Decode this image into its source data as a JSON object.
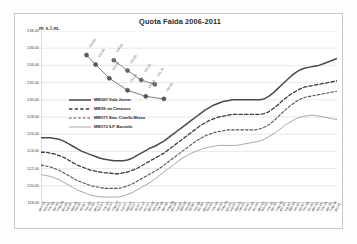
{
  "chart_data": {
    "type": "line",
    "title": "Quota Falda 2006-2011",
    "xlabel": "",
    "ylabel": "m s.l.m.",
    "ylim": [
      118.0,
      138.0
    ],
    "ytick_step": 2.0,
    "yticks": [
      "138,00",
      "136,00",
      "134,00",
      "132,00",
      "130,00",
      "128,00",
      "126,00",
      "124,00",
      "122,00",
      "120,00",
      "118,00"
    ],
    "grid": true,
    "legend_position": "inside-upper-left",
    "x": [
      "gen-06",
      "feb-06",
      "mar-06",
      "apr-06",
      "mag-06",
      "giu-06",
      "lug-06",
      "ago-06",
      "set-06",
      "ott-06",
      "nov-06",
      "dic-06",
      "gen-07",
      "feb-07",
      "mar-07",
      "apr-07",
      "mag-07",
      "giu-07",
      "lug-07",
      "ago-07",
      "set-07",
      "ott-07",
      "nov-07",
      "dic-07",
      "gen-08",
      "feb-08",
      "mar-08",
      "apr-08",
      "mag-08",
      "giu-08",
      "lug-08",
      "ago-08",
      "set-08",
      "ott-08",
      "nov-08",
      "dic-08",
      "gen-09",
      "feb-09",
      "mar-09",
      "apr-09",
      "mag-09",
      "giu-09",
      "lug-09",
      "ago-09",
      "set-09",
      "ott-09",
      "nov-09",
      "dic-09",
      "gen-10",
      "feb-10",
      "mar-10",
      "apr-10",
      "mag-10",
      "giu-10",
      "lug-10",
      "ago-10",
      "set-10",
      "ott-10",
      "nov-10",
      "dic-10",
      "gen-11",
      "feb-11",
      "mar-11",
      "apr-11",
      "mag-11",
      "giu-11"
    ],
    "series": [
      {
        "name": "MM/307 Viale Jenner",
        "style": "solid-dark",
        "color": "#4a4a4a",
        "values": [
          125.6,
          125.6,
          125.6,
          125.5,
          125.4,
          125.2,
          124.9,
          124.6,
          124.3,
          124.0,
          123.8,
          123.6,
          123.4,
          123.2,
          123.1,
          123.0,
          122.9,
          122.9,
          122.9,
          123.0,
          123.2,
          123.5,
          123.8,
          124.1,
          124.4,
          124.6,
          124.9,
          125.2,
          125.6,
          126.0,
          126.4,
          126.8,
          127.2,
          127.6,
          128.0,
          128.4,
          128.8,
          129.1,
          129.4,
          129.6,
          129.8,
          129.9,
          130.0,
          130.0,
          130.0,
          130.0,
          130.0,
          130.0,
          130.0,
          130.1,
          130.4,
          130.8,
          131.3,
          131.8,
          132.3,
          132.8,
          133.2,
          133.5,
          133.7,
          133.8,
          133.9,
          134.0,
          134.2,
          134.4,
          134.6,
          134.8
        ]
      },
      {
        "name": "MM/29 via Cimarosa",
        "style": "dashed-dark",
        "color": "#3c3c3c",
        "values": [
          123.9,
          123.9,
          123.8,
          123.7,
          123.5,
          123.3,
          123.0,
          122.7,
          122.4,
          122.2,
          122.0,
          121.8,
          121.7,
          121.6,
          121.5,
          121.5,
          121.4,
          121.4,
          121.5,
          121.6,
          121.8,
          122.0,
          122.3,
          122.6,
          122.9,
          123.2,
          123.5,
          123.8,
          124.2,
          124.6,
          125.0,
          125.4,
          125.8,
          126.2,
          126.6,
          127.0,
          127.3,
          127.6,
          127.8,
          128.0,
          128.1,
          128.2,
          128.3,
          128.3,
          128.3,
          128.3,
          128.3,
          128.3,
          128.3,
          128.4,
          128.6,
          129.0,
          129.4,
          129.9,
          130.3,
          130.7,
          131.0,
          131.3,
          131.5,
          131.6,
          131.7,
          131.8,
          131.9,
          132.0,
          132.1,
          132.2
        ]
      },
      {
        "name": "MM/171 Stac. Cistello Mezzo",
        "style": "dashed-mid",
        "color": "#555555",
        "values": [
          122.4,
          122.3,
          122.2,
          122.0,
          121.8,
          121.5,
          121.2,
          120.9,
          120.6,
          120.4,
          120.2,
          120.0,
          119.9,
          119.8,
          119.7,
          119.7,
          119.7,
          119.7,
          119.8,
          120.0,
          120.2,
          120.5,
          120.8,
          121.1,
          121.4,
          121.7,
          122.0,
          122.4,
          122.8,
          123.2,
          123.6,
          124.0,
          124.4,
          124.8,
          125.2,
          125.5,
          125.8,
          126.0,
          126.2,
          126.3,
          126.4,
          126.5,
          126.5,
          126.5,
          126.5,
          126.5,
          126.5,
          126.5,
          126.6,
          126.8,
          127.1,
          127.5,
          128.0,
          128.5,
          129.0,
          129.4,
          129.8,
          130.1,
          130.3,
          130.4,
          130.5,
          130.6,
          130.7,
          130.8,
          130.9,
          131.0
        ]
      },
      {
        "name": "MM/172 S.P. Bacciolo",
        "style": "solid-light",
        "color": "#a8a8a8",
        "values": [
          121.3,
          121.2,
          121.1,
          120.9,
          120.7,
          120.4,
          120.1,
          119.8,
          119.5,
          119.3,
          119.1,
          118.9,
          118.8,
          118.7,
          118.7,
          118.7,
          118.7,
          118.7,
          118.8,
          119.0,
          119.2,
          119.5,
          119.8,
          120.1,
          120.4,
          120.8,
          121.2,
          121.6,
          122.0,
          122.4,
          122.8,
          123.2,
          123.5,
          123.8,
          124.0,
          124.2,
          124.4,
          124.5,
          124.6,
          124.7,
          124.7,
          124.7,
          124.7,
          124.7,
          124.8,
          124.9,
          125.0,
          125.1,
          125.2,
          125.4,
          125.7,
          126.0,
          126.4,
          126.8,
          127.2,
          127.5,
          127.8,
          128.0,
          128.1,
          128.2,
          128.2,
          128.1,
          128.0,
          127.9,
          127.8,
          127.7
        ]
      }
    ],
    "overlay_series": [
      {
        "name": "serie-marcata-1",
        "marker": "circle",
        "color": "#5a5a5a",
        "points": [
          {
            "x_index": 10,
            "y": 135.2,
            "label": "134,80"
          },
          {
            "x_index": 12,
            "y": 134.1,
            "label": "133,90"
          },
          {
            "x_index": 15,
            "y": 132.5,
            "label": "132,40"
          },
          {
            "x_index": 19,
            "y": 131.1,
            "label": "131,20"
          },
          {
            "x_index": 23,
            "y": 130.4,
            "label": "130,50"
          },
          {
            "x_index": 27,
            "y": 130.1,
            "label": "130,10"
          }
        ]
      },
      {
        "name": "serie-marcata-2",
        "marker": "circle",
        "color": "#6b6b6b",
        "points": [
          {
            "x_index": 16,
            "y": 134.6,
            "label": "134,50"
          },
          {
            "x_index": 19,
            "y": 133.4,
            "label": "133,30"
          },
          {
            "x_index": 22,
            "y": 132.3,
            "label": "132,20"
          },
          {
            "x_index": 25,
            "y": 131.8,
            "label": "131,70"
          }
        ]
      }
    ],
    "annotations": [
      "134,80",
      "133,90",
      "132,40",
      "131,20",
      "130,50",
      "130,10",
      "134,50",
      "133,30",
      "132,20",
      "131,70"
    ]
  },
  "colors": {
    "frame": "#c9c9c9",
    "grid": "#d9d9d9",
    "axis": "#9a9a9a",
    "text": "#2b2b2b",
    "background": "#ffffff"
  }
}
